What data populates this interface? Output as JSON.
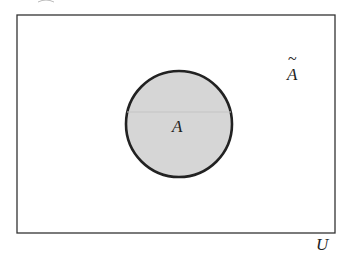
{
  "diagram": {
    "type": "venn",
    "universe": {
      "label": "U",
      "x": 17,
      "y": 15,
      "width": 318,
      "height": 218
    },
    "set": {
      "label": "A",
      "cx": 179,
      "cy": 124,
      "r": 53,
      "fill": "#d6d6d6",
      "stroke": "#222222"
    },
    "complement": {
      "label": "A",
      "tilde": "~"
    }
  }
}
